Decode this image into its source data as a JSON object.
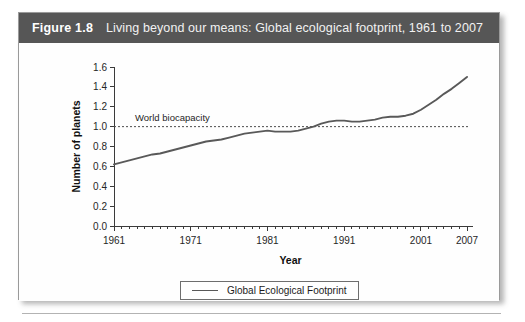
{
  "figure": {
    "number": "Figure 1.8",
    "caption": "Living beyond our means: Global ecological footprint, 1961 to 2007"
  },
  "legend": {
    "label": "Global Ecological Footprint",
    "swatch_color": "#595959"
  },
  "chart_data": {
    "type": "line",
    "title": "Living beyond our means: Global ecological footprint, 1961 to 2007",
    "xlabel": "Year",
    "ylabel": "Number of planets",
    "xlim": [
      1961,
      2007
    ],
    "ylim": [
      0.0,
      1.6
    ],
    "grid": false,
    "legend_position": "bottom-center",
    "x_tick_labels": [
      "1961",
      "1971",
      "1981",
      "1991",
      "2001",
      "2007"
    ],
    "x_tick_values": [
      1961,
      1971,
      1981,
      1991,
      2001,
      2007
    ],
    "x_minor_ticks_every": 1,
    "y_tick_labels": [
      "0.0",
      "0.2",
      "0.4",
      "0.6",
      "0.8",
      "1.0",
      "1.2",
      "1.4",
      "1.6"
    ],
    "y_tick_values": [
      0.0,
      0.2,
      0.4,
      0.6,
      0.8,
      1.0,
      1.2,
      1.4,
      1.6
    ],
    "annotations": [
      {
        "text": "World biocapacity",
        "y_value": 1.0,
        "style": "dotted-horizontal-reference-line"
      }
    ],
    "series": [
      {
        "name": "Global Ecological Footprint",
        "color": "#595959",
        "x": [
          1961,
          1962,
          1963,
          1964,
          1965,
          1966,
          1967,
          1968,
          1969,
          1970,
          1971,
          1972,
          1973,
          1974,
          1975,
          1976,
          1977,
          1978,
          1979,
          1980,
          1981,
          1982,
          1983,
          1984,
          1985,
          1986,
          1987,
          1988,
          1989,
          1990,
          1991,
          1992,
          1993,
          1994,
          1995,
          1996,
          1997,
          1998,
          1999,
          2000,
          2001,
          2002,
          2003,
          2004,
          2005,
          2006,
          2007
        ],
        "values": [
          0.62,
          0.64,
          0.66,
          0.68,
          0.7,
          0.72,
          0.73,
          0.75,
          0.77,
          0.79,
          0.81,
          0.83,
          0.85,
          0.86,
          0.87,
          0.89,
          0.91,
          0.93,
          0.94,
          0.95,
          0.96,
          0.95,
          0.95,
          0.95,
          0.96,
          0.98,
          1.0,
          1.03,
          1.05,
          1.06,
          1.06,
          1.05,
          1.05,
          1.06,
          1.07,
          1.09,
          1.1,
          1.1,
          1.11,
          1.13,
          1.17,
          1.22,
          1.27,
          1.33,
          1.38,
          1.44,
          1.5
        ]
      }
    ]
  }
}
